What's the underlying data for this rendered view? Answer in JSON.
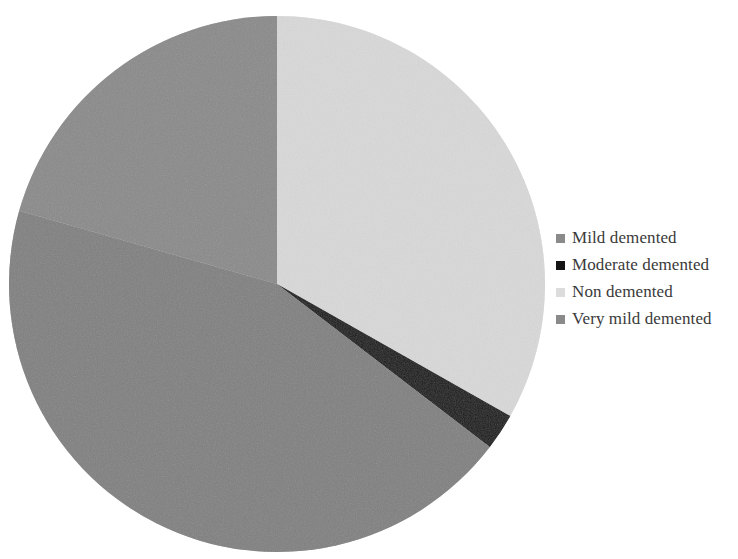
{
  "chart_data": {
    "type": "pie",
    "title": "",
    "subtitle": "",
    "xlabel": "",
    "ylabel": "",
    "grid": false,
    "legend_position": "right",
    "start_angle_deg": 90,
    "direction": "clockwise",
    "categories": [
      "Mild demented",
      "Moderate demented",
      "Non demented",
      "Very mild demented"
    ],
    "values": [
      44.0,
      2.2,
      33.2,
      20.6
    ],
    "colors": [
      "#808080",
      "#111111",
      "#d9d9d9",
      "#8a8a8a"
    ],
    "slices": [
      {
        "label": "Mild demented",
        "value": 44.0,
        "color": "#808080",
        "order": 3
      },
      {
        "label": "Moderate demented",
        "value": 2.2,
        "color": "#111111",
        "order": 2
      },
      {
        "label": "Non demented",
        "value": 33.2,
        "color": "#d9d9d9",
        "order": 1
      },
      {
        "label": "Very mild demented",
        "value": 20.6,
        "color": "#8a8a8a",
        "order": 4
      }
    ]
  },
  "legend": {
    "items": [
      {
        "label": "Mild demented",
        "swatch_color": "#8a8a8a",
        "marker": "square-marker"
      },
      {
        "label": "Moderate demented",
        "swatch_color": "#141414",
        "marker": "square-marker"
      },
      {
        "label": "Non demented",
        "swatch_color": "#dcdcdc",
        "marker": "square-marker"
      },
      {
        "label": "Very mild demented",
        "swatch_color": "#8a8a8a",
        "marker": "square-marker"
      }
    ]
  },
  "canvas": {
    "background": "#ffffff",
    "pie_center_x": 277,
    "pie_center_y": 284,
    "pie_radius": 268
  }
}
